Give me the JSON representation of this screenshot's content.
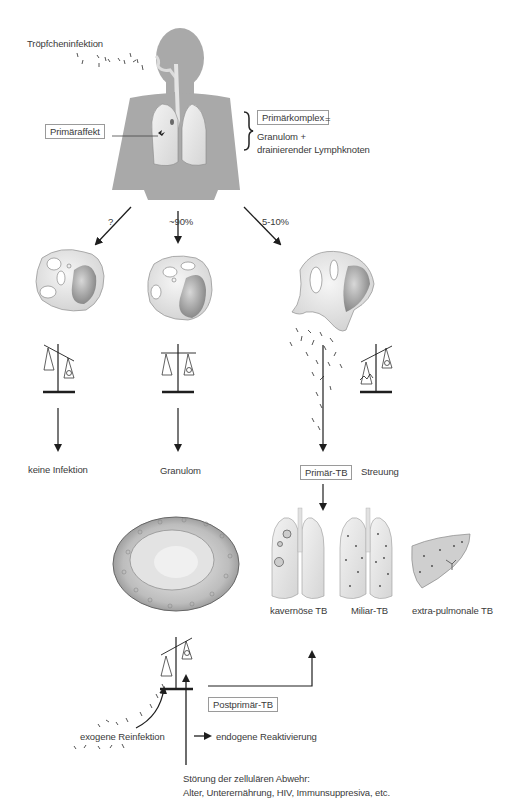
{
  "figure": {
    "top": {
      "infection_label": "Tröpfcheninfektion",
      "primary_lesion_label": "Primäraffekt",
      "primary_complex_label": "Primärkomplex",
      "primary_complex_equals": "=",
      "primary_complex_def_line1": "Granulom +",
      "primary_complex_def_line2": "drainierender Lymphknoten"
    },
    "branches": [
      {
        "probability": "?",
        "outcome": "keine Infektion",
        "balance": "tilted-left-up"
      },
      {
        "probability": "~90%",
        "outcome": "Granulom",
        "balance": "balanced"
      },
      {
        "probability": "5-10%",
        "outcome": "Primär-TB",
        "outcome_boxed": true,
        "side_label": "Streuung",
        "balance": "tilted-right-up"
      }
    ],
    "primary_tb_forms": [
      {
        "label": "kavernöse TB"
      },
      {
        "label": "Miliar-TB"
      },
      {
        "label": "extra-pulmonale TB"
      }
    ],
    "reactivation": {
      "postprimary_label": "Postprimär-TB",
      "exogenous_label": "exogene Reinfektion",
      "endogenous_label": "endogene Reaktivierung",
      "immune_disorder_line1": "Störung der zellulären Abwehr:",
      "immune_disorder_line2": "Alter, Unterernährung, HIV, Immunsuppresiva, etc."
    }
  },
  "colors": {
    "body_silhouette": "#a9a9a9",
    "lung_fill": "#e6e6e6",
    "cell_fill": "#e9e9e9",
    "nucleus_fill": "#9c9c9c",
    "line": "#1e1e1e",
    "box_border": "#9a9a9a"
  }
}
